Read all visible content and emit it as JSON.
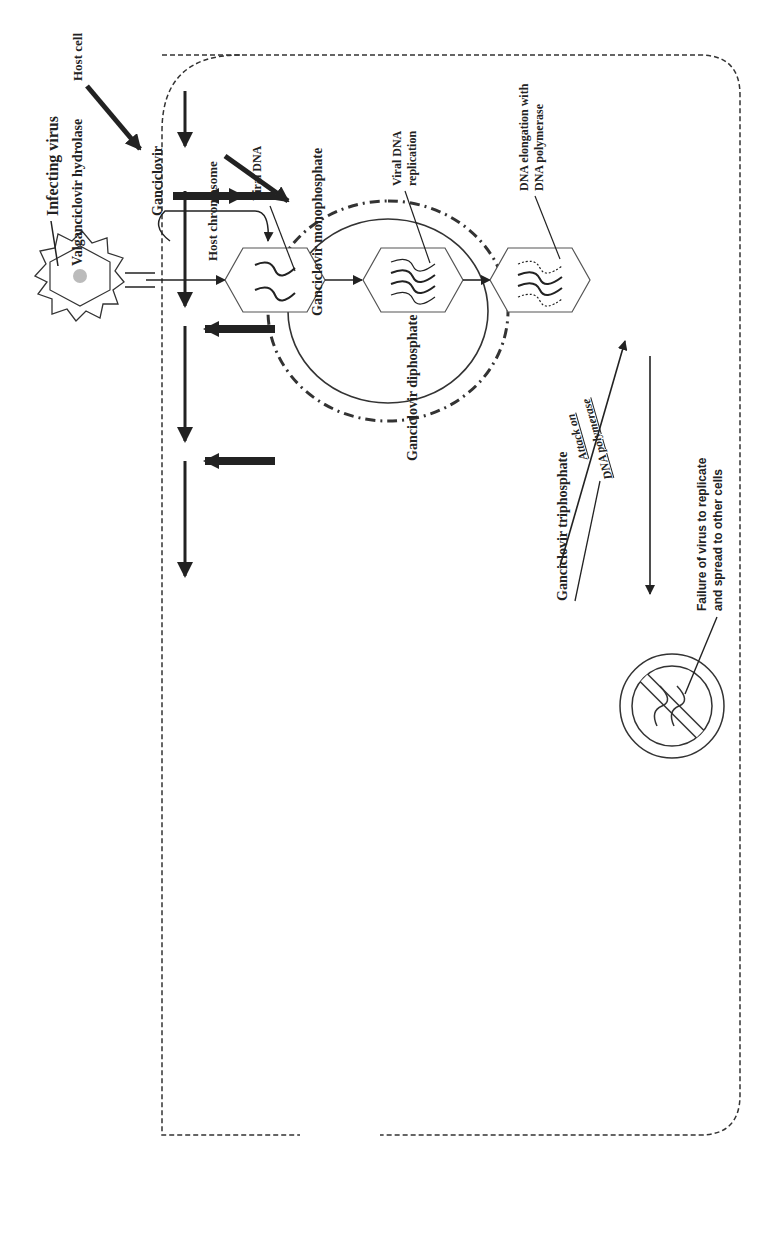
{
  "figure": {
    "orientation": "rotated 90 degrees counter-clockwise"
  },
  "labels": {
    "host_cell": "Host cell",
    "host_chromosome": "Host chromosome",
    "infecting_virus": "Infecting virus",
    "viral_dna": "Viral DNA",
    "viral_dna_replication_1": "Viral DNA",
    "viral_dna_replication_2": "replication",
    "dna_elongation_1": "DNA elongation with",
    "dna_elongation_2": "DNA polymerase",
    "attack_1": "Attack on",
    "attack_2": "DNA polymerase",
    "failure_1": "Failure of virus to replicate",
    "failure_2": "and spread to other cells"
  },
  "pathway": {
    "valganciclovir_hydrolase": "Valganciclovir hydrolase",
    "ganciclovir": "Ganciclovir",
    "monophosphate": "Ganciclovir monophosphate",
    "diphosphate": "Ganciclovir diphosphate",
    "triphosphate": "Ganciclovir triphosphate",
    "po4": "PO4",
    "enzyme1_1": "Viral",
    "enzyme1_2": "thymidine",
    "enzyme1_3": "kinase",
    "enzyme2_1": "Host",
    "enzyme2_2": "cellular",
    "enzyme2_3": "enzymes",
    "enzyme3_1": "Host cellular",
    "enzyme3_2": "enzymes"
  },
  "colors": {
    "ink": "#222222",
    "background": "#ffffff",
    "virus_core": "#bbbbbb"
  }
}
